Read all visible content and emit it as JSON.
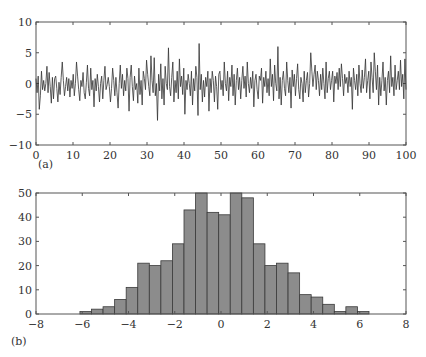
{
  "chart_data": [
    {
      "panel_label": "(a)",
      "type": "line",
      "title": "",
      "xlabel": "",
      "ylabel": "",
      "xlim": [
        0,
        100
      ],
      "ylim": [
        -10,
        10
      ],
      "xticks": [
        0,
        10,
        20,
        30,
        40,
        50,
        60,
        70,
        80,
        90,
        100
      ],
      "yticks": [
        -10,
        -5,
        0,
        5,
        10
      ],
      "grid": false,
      "line_color": "#333333",
      "description": "Random noise time series, roughly zero-mean with standard deviation about 2, ranging approximately between -6 and 6.5",
      "x_step": 0.5,
      "values": [
        0.8,
        -1.5,
        1.2,
        -4.2,
        -2.0,
        2.0,
        -1.0,
        0.5,
        -1.2,
        0.0,
        2.8,
        -1.5,
        1.8,
        -0.5,
        -3.2,
        1.0,
        -2.5,
        0.8,
        1.2,
        -0.8,
        -3.0,
        0.2,
        -1.8,
        1.0,
        3.5,
        0.5,
        -2.0,
        -0.5,
        1.0,
        -1.2,
        0.8,
        -2.2,
        0.5,
        -0.8,
        1.5,
        -2.0,
        0.0,
        3.5,
        1.2,
        -1.0,
        -2.8,
        0.5,
        -0.5,
        1.8,
        -1.5,
        -2.5,
        0.2,
        3.0,
        -0.8,
        -2.0,
        2.5,
        -1.0,
        0.5,
        -3.8,
        0.8,
        -1.2,
        1.5,
        -0.5,
        -3.0,
        0.0,
        1.2,
        -2.5,
        0.5,
        2.8,
        -1.0,
        -0.2,
        1.0,
        -0.5,
        -3.0,
        -0.8,
        2.5,
        0.5,
        -2.0,
        1.0,
        -1.5,
        -4.0,
        0.0,
        3.0,
        -0.8,
        1.5,
        -2.0,
        0.5,
        -1.2,
        2.5,
        0.8,
        -4.5,
        1.0,
        3.0,
        -0.5,
        -2.8,
        1.2,
        -1.0,
        0.0,
        -3.2,
        2.5,
        -1.8,
        0.5,
        -3.5,
        2.0,
        0.8,
        -1.0,
        3.8,
        1.5,
        -0.5,
        -2.0,
        4.5,
        0.5,
        -1.5,
        4.2,
        -2.0,
        0.0,
        -6.0,
        1.5,
        -1.2,
        3.2,
        -2.5,
        0.8,
        -3.5,
        2.8,
        0.0,
        -1.0,
        5.8,
        -0.5,
        -2.0,
        1.0,
        3.5,
        -3.0,
        0.5,
        -1.5,
        2.0,
        -2.5,
        4.0,
        -0.5,
        1.2,
        -1.8,
        2.5,
        -5.0,
        0.5,
        -1.0,
        1.5,
        0.0,
        -2.0,
        2.0,
        -3.5,
        0.8,
        -1.2,
        2.8,
        1.0,
        -5.2,
        6.5,
        -1.0,
        1.5,
        -3.0,
        0.5,
        -2.2,
        1.0,
        -0.5,
        2.0,
        -4.5,
        0.8,
        -1.5,
        2.0,
        0.5,
        -3.0,
        1.2,
        -0.5,
        -4.2,
        1.5,
        2.0,
        -1.0,
        0.5,
        -2.0,
        3.5,
        0.0,
        -1.2,
        2.0,
        -2.8,
        1.0,
        -0.5,
        3.0,
        -2.0,
        1.5,
        -3.5,
        0.5,
        2.5,
        -1.0,
        1.0,
        -2.5,
        0.5,
        2.8,
        -0.8,
        1.2,
        -2.2,
        3.5,
        0.0,
        -1.5,
        1.0,
        -0.8,
        2.0,
        -3.8,
        0.5,
        1.5,
        -1.0,
        -2.5,
        1.2,
        0.5,
        2.5,
        -3.2,
        1.0,
        -0.5,
        2.0,
        -1.5,
        0.8,
        -2.0,
        4.0,
        -0.5,
        1.5,
        -2.8,
        3.0,
        0.0,
        -1.2,
        6.0,
        -2.5,
        1.0,
        -3.5,
        0.5,
        2.0,
        -0.8,
        -2.0,
        3.5,
        0.5,
        -1.5,
        1.0,
        -4.0,
        2.2,
        -0.5,
        1.5,
        -2.0,
        0.8,
        3.2,
        -1.0,
        -2.5,
        1.0,
        0.0,
        -3.0,
        2.0,
        -1.5,
        0.5,
        1.8,
        -2.2,
        0.0,
        5.0,
        2.0,
        -0.5,
        1.5,
        3.0,
        -1.0,
        2.0,
        0.5,
        -2.0,
        1.5,
        -1.0,
        2.5,
        0.0,
        -2.5,
        3.5,
        -1.5,
        0.8,
        2.0,
        -1.0,
        0.5,
        2.0,
        -3.0,
        1.2,
        0.0,
        1.8,
        -1.0,
        2.5,
        -0.5,
        3.2,
        0.8,
        -2.0,
        1.5,
        0.0,
        1.0,
        -1.5,
        2.0,
        -0.5,
        1.0,
        -4.2,
        2.5,
        0.5,
        -1.0,
        1.5,
        -2.0,
        3.0,
        0.0,
        -1.5,
        2.2,
        -0.8,
        1.0,
        4.0,
        -1.5,
        0.5,
        2.0,
        -2.5,
        3.5,
        1.0,
        -1.5,
        5.0,
        2.0,
        -1.0,
        3.0,
        -3.5,
        1.0,
        -2.0,
        0.5,
        3.5,
        -1.2,
        1.0,
        -3.5,
        0.5,
        2.0,
        -1.5,
        4.5,
        -0.5,
        1.0,
        -2.0,
        3.0,
        -1.0,
        0.5,
        2.0,
        -1.0,
        3.8,
        -0.5,
        1.5,
        -2.5,
        4.0,
        -1.0
      ]
    },
    {
      "panel_label": "(b)",
      "type": "bar",
      "title": "",
      "xlabel": "",
      "ylabel": "",
      "xlim": [
        -8,
        8
      ],
      "ylim": [
        0,
        50
      ],
      "xticks": [
        -8,
        -6,
        -4,
        -2,
        0,
        2,
        4,
        6,
        8
      ],
      "yticks": [
        0,
        10,
        20,
        30,
        40,
        50
      ],
      "grid": false,
      "bar_color": "#8c8c8c",
      "edge_color": "#3a3a3a",
      "bin_start": -6.1,
      "bin_width": 0.5,
      "bin_centers": [
        -5.85,
        -5.35,
        -4.85,
        -4.35,
        -3.85,
        -3.35,
        -2.85,
        -2.35,
        -1.85,
        -1.35,
        -0.85,
        -0.35,
        0.15,
        0.65,
        1.15,
        1.65,
        2.15,
        2.65,
        3.15,
        3.65,
        4.15,
        4.65,
        5.15,
        5.65,
        6.15
      ],
      "values": [
        1,
        2,
        3,
        6,
        11,
        21,
        20,
        22,
        29,
        43,
        50,
        42,
        41,
        50,
        48,
        29,
        20,
        21,
        17,
        8,
        7,
        4,
        1,
        3,
        1
      ]
    }
  ]
}
